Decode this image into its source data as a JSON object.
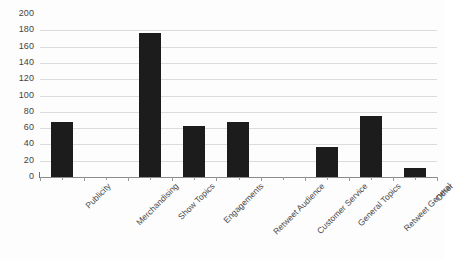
{
  "chart_data": {
    "type": "bar",
    "title": "",
    "subtitle": "",
    "xlabel": "",
    "ylabel": "",
    "categories": [
      "Publicity",
      "Merchandising",
      "Show Topics",
      "Engagements",
      "Retweet Audience",
      "Customer Service",
      "General Topics",
      "Retweet General",
      "Other"
    ],
    "values": [
      68,
      0,
      177,
      62,
      67,
      0,
      37,
      75,
      11
    ],
    "ylim": [
      0,
      200
    ],
    "ytick_values": [
      0,
      20,
      40,
      60,
      80,
      100,
      120,
      140,
      160,
      180,
      200
    ],
    "ytick_labels": [
      "0",
      "20",
      "40",
      "60",
      "80",
      "100",
      "120",
      "140",
      "160",
      "180",
      "200"
    ],
    "grid": true,
    "grid_axis": "y",
    "legend": false,
    "legend_position": "none",
    "bar_color": "#1c1c1c",
    "grid_color": "#dcdcdc",
    "axis_color": "#8a8a8a",
    "background_color": "#fdfdfd",
    "xtick_label_rotation": -45
  }
}
